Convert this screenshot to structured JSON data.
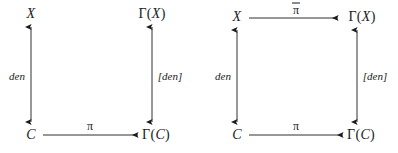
{
  "figure": {
    "type": "commutative-diagram-pair",
    "background_color": "#ffffff",
    "stroke_color": "#1a1a1a",
    "diagrams": [
      {
        "id": "left",
        "nodes": {
          "top_left": "X",
          "top_right_gamma": "Γ(",
          "top_right_var": "X",
          "top_right_close": ")",
          "bottom_left": "C",
          "bottom_right_gamma": "Γ(",
          "bottom_right_var": "C",
          "bottom_right_close": ")"
        },
        "arrows": {
          "left_vertical_label": "den",
          "right_vertical_label": "[den]",
          "bottom_label": "π",
          "top_label": null
        }
      },
      {
        "id": "right",
        "nodes": {
          "top_left": "X",
          "top_right_gamma": "Γ(",
          "top_right_var": "X",
          "top_right_close": ")",
          "bottom_left": "C",
          "bottom_right_gamma": "Γ(",
          "bottom_right_var": "C",
          "bottom_right_close": ")"
        },
        "arrows": {
          "left_vertical_label": "den",
          "right_vertical_label": "[den]",
          "bottom_label": "π",
          "top_label": "π",
          "top_label_has_overline": true
        }
      }
    ]
  }
}
